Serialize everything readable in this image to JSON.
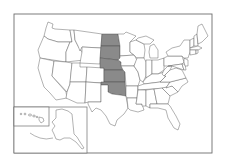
{
  "map": {
    "title": "United States",
    "highlight_color": "#8a8a8a",
    "base_color": "#ffffff",
    "border_color": "#555555",
    "highlighted_states": [
      "North Dakota",
      "South Dakota",
      "Nebraska",
      "Kansas",
      "Oklahoma"
    ],
    "insets": [
      "Alaska",
      "Hawaii"
    ]
  }
}
